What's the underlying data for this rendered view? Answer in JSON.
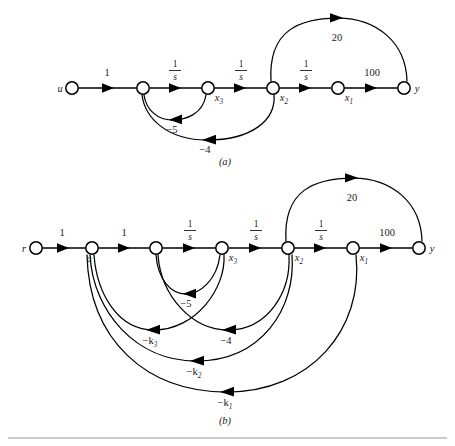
{
  "figure": {
    "type": "signal-flow-graph",
    "captions": {
      "a": "(a)",
      "b": "(b)"
    }
  },
  "graph_a": {
    "nodes": [
      {
        "id": "u",
        "label": "u",
        "sub": "",
        "x": 72,
        "y": 88
      },
      {
        "id": "n2",
        "label": "",
        "sub": "",
        "x": 143,
        "y": 88
      },
      {
        "id": "x3",
        "label": "x",
        "sub": "3",
        "x": 208,
        "y": 88
      },
      {
        "id": "x2",
        "label": "x",
        "sub": "2",
        "x": 273,
        "y": 88
      },
      {
        "id": "x1",
        "label": "x",
        "sub": "1",
        "x": 338,
        "y": 88
      },
      {
        "id": "y",
        "label": "y",
        "sub": "",
        "x": 404,
        "y": 88
      }
    ],
    "edges": [
      {
        "from": "u",
        "to": "n2",
        "gain": "1",
        "kind": "straight"
      },
      {
        "from": "n2",
        "to": "x3",
        "gain": "1/s",
        "kind": "straight"
      },
      {
        "from": "x3",
        "to": "x2",
        "gain": "1/s",
        "kind": "straight"
      },
      {
        "from": "x2",
        "to": "x1",
        "gain": "1/s",
        "kind": "straight"
      },
      {
        "from": "x1",
        "to": "y",
        "gain": "100",
        "kind": "straight"
      },
      {
        "from": "x2",
        "to": "y",
        "gain": "20",
        "kind": "arc-above"
      },
      {
        "from": "x3",
        "to": "n2",
        "gain": "-5",
        "kind": "arc-below"
      },
      {
        "from": "x2",
        "to": "n2",
        "gain": "-4",
        "kind": "arc-below"
      }
    ],
    "gain_labels": [
      {
        "text": "1",
        "x": 107,
        "y": 74
      },
      {
        "text": "1/s",
        "x": 175,
        "y": 72
      },
      {
        "text": "1/s",
        "x": 241,
        "y": 72
      },
      {
        "text": "1/s",
        "x": 306,
        "y": 72
      },
      {
        "text": "100",
        "x": 372,
        "y": 74
      },
      {
        "text": "20",
        "x": 337,
        "y": 39
      },
      {
        "text": "-5",
        "x": 180,
        "y": 124
      },
      {
        "text": "-4",
        "x": 207,
        "y": 145
      }
    ]
  },
  "graph_b": {
    "nodes": [
      {
        "id": "r",
        "label": "r",
        "sub": "",
        "x": 36,
        "y": 248
      },
      {
        "id": "u",
        "label": "u",
        "sub": "",
        "x": 92,
        "y": 248
      },
      {
        "id": "n3",
        "label": "",
        "sub": "",
        "x": 156,
        "y": 248
      },
      {
        "id": "x3",
        "label": "x",
        "sub": "3",
        "x": 222,
        "y": 248
      },
      {
        "id": "x2",
        "label": "x",
        "sub": "2",
        "x": 288,
        "y": 248
      },
      {
        "id": "x1",
        "label": "x",
        "sub": "1",
        "x": 353,
        "y": 248
      },
      {
        "id": "y",
        "label": "y",
        "sub": "",
        "x": 419,
        "y": 248
      }
    ],
    "edges": [
      {
        "from": "r",
        "to": "u",
        "gain": "1",
        "kind": "straight"
      },
      {
        "from": "u",
        "to": "n3",
        "gain": "1",
        "kind": "straight"
      },
      {
        "from": "n3",
        "to": "x3",
        "gain": "1/s",
        "kind": "straight"
      },
      {
        "from": "x3",
        "to": "x2",
        "gain": "1/s",
        "kind": "straight"
      },
      {
        "from": "x2",
        "to": "x1",
        "gain": "1/s",
        "kind": "straight"
      },
      {
        "from": "x1",
        "to": "y",
        "gain": "100",
        "kind": "straight"
      },
      {
        "from": "x2",
        "to": "y",
        "gain": "20",
        "kind": "arc-above"
      },
      {
        "from": "x3",
        "to": "n3",
        "gain": "-5",
        "kind": "arc-below"
      },
      {
        "from": "x2",
        "to": "n3",
        "gain": "-4",
        "kind": "arc-below"
      },
      {
        "from": "x3",
        "to": "u",
        "gain": "-k3",
        "kind": "arc-below"
      },
      {
        "from": "x2",
        "to": "u",
        "gain": "-k2",
        "kind": "arc-below"
      },
      {
        "from": "x1",
        "to": "u",
        "gain": "-k1",
        "kind": "arc-below"
      }
    ],
    "gain_labels": [
      {
        "text": "1",
        "x": 62,
        "y": 234
      },
      {
        "text": "1",
        "x": 124,
        "y": 234
      },
      {
        "text": "1/s",
        "x": 190,
        "y": 232
      },
      {
        "text": "1/s",
        "x": 256,
        "y": 232
      },
      {
        "text": "1/s",
        "x": 321,
        "y": 232
      },
      {
        "text": "100",
        "x": 387,
        "y": 234
      },
      {
        "text": "20",
        "x": 352,
        "y": 199
      },
      {
        "text": "-5",
        "x": 190,
        "y": 302
      },
      {
        "text": "-k3",
        "x": 152,
        "y": 338
      },
      {
        "text": "-4",
        "x": 227,
        "y": 338
      },
      {
        "text": "-k2",
        "x": 194,
        "y": 369
      },
      {
        "text": "-k1",
        "x": 225,
        "y": 400
      }
    ]
  },
  "labels": {
    "u": "u",
    "r": "r",
    "y": "y",
    "x": "x",
    "sub1": "1",
    "sub2": "2",
    "sub3": "3",
    "one": "1",
    "hundred": "100",
    "twenty": "20",
    "minus_five": "−5",
    "minus_four": "−4",
    "minus_k": "−k",
    "frac_num": "1",
    "frac_den": "s"
  },
  "colors": {
    "stroke": "#000000",
    "text": "#1a1a1a",
    "background": "#ffffff",
    "rule": "#9a9a9a"
  }
}
